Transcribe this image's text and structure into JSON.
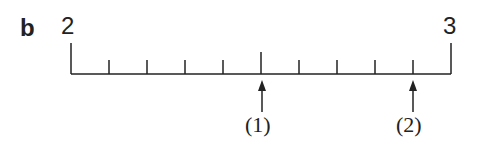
{
  "panel_label": "b",
  "number_line": {
    "start_label": "2",
    "end_label": "3",
    "divisions": 10,
    "major_tick_index": 5
  },
  "arrows": [
    {
      "label": "(1)",
      "tick_index": 5
    },
    {
      "label": "(2)",
      "tick_index": 9
    }
  ],
  "colors": {
    "ink": "#222222"
  }
}
